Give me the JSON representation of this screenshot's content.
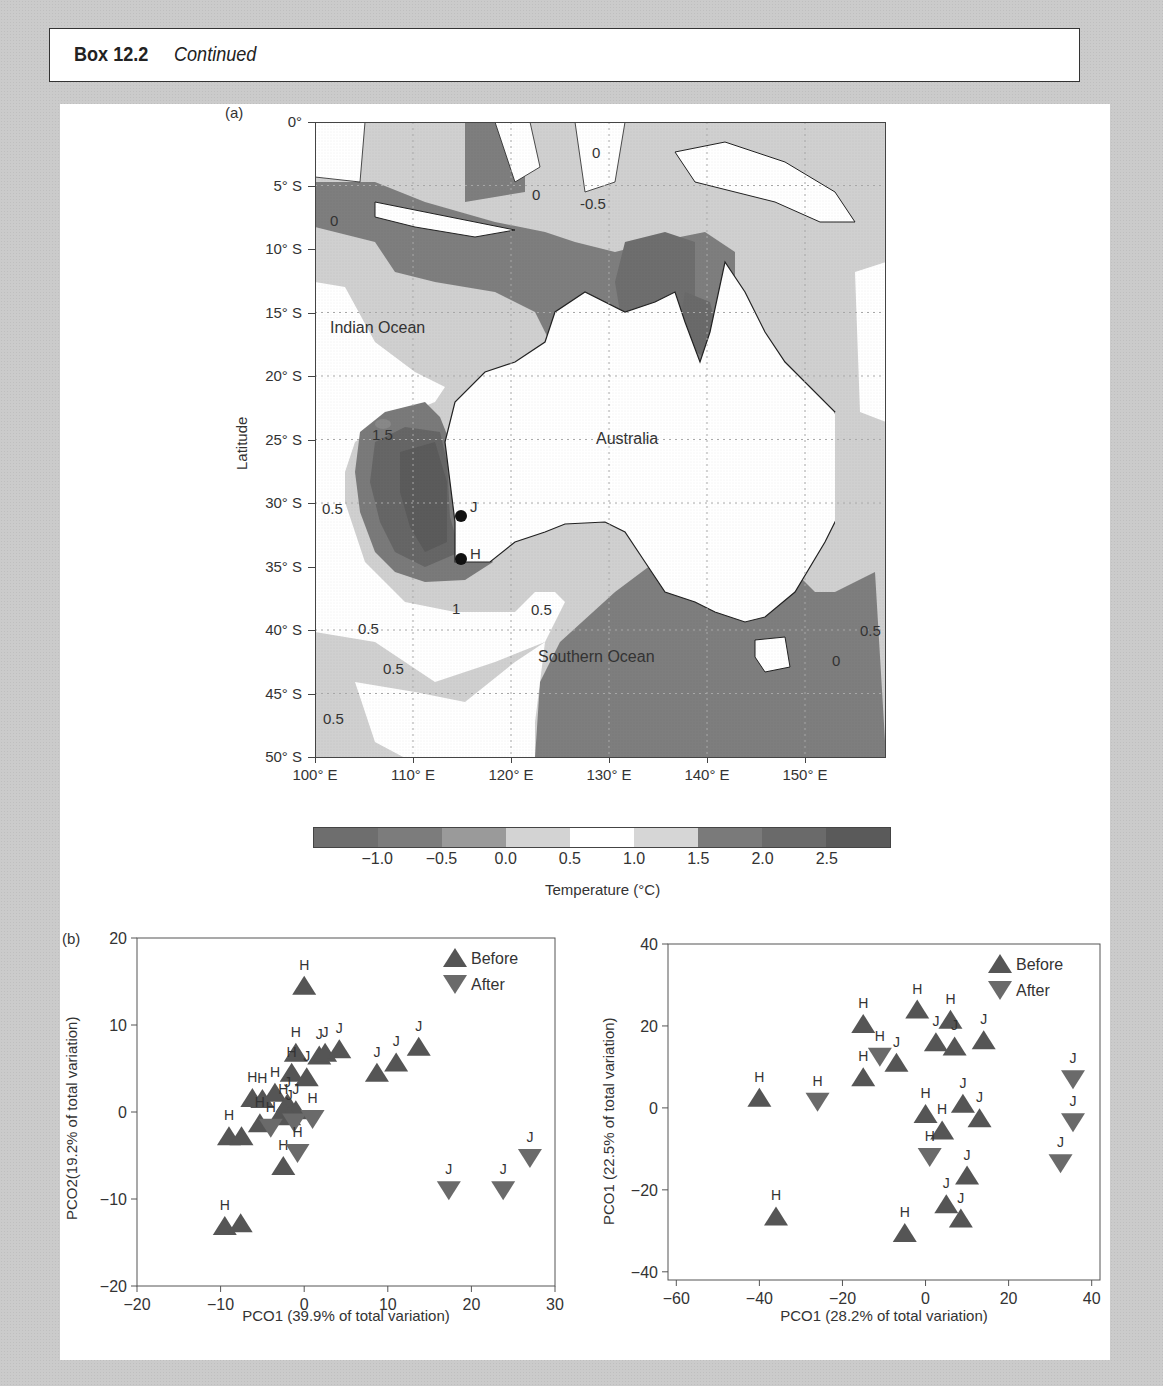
{
  "header": {
    "box_number": "Box 12.2",
    "continued": "Continued"
  },
  "panel_a": {
    "label": "(a)",
    "ylabel": "Latitude",
    "lat_ticks": [
      "0°",
      "5° S",
      "10° S",
      "15° S",
      "20° S",
      "25° S",
      "30° S",
      "35° S",
      "40° S",
      "45° S",
      "50° S"
    ],
    "lon_ticks": [
      "100° E",
      "110° E",
      "120° E",
      "130° E",
      "140° E",
      "150° E"
    ],
    "region_labels": {
      "indian_ocean": "Indian Ocean",
      "australia": "Australia",
      "southern_ocean": "Southern Ocean"
    },
    "site_labels": {
      "j": "J",
      "h": "H"
    },
    "contour_labels": [
      "0",
      "0",
      "0",
      "-0.5",
      "1.5",
      "0.5",
      "1",
      "0.5",
      "0.5",
      "0.5",
      "0.5",
      "0.5",
      "0"
    ],
    "colorbar": {
      "ticks": [
        "−1.0",
        "−0.5",
        "0.0",
        "0.5",
        "1.0",
        "1.5",
        "2.0",
        "2.5"
      ],
      "colors": [
        "#6e6e6e",
        "#7c7c7c",
        "#9a9a9a",
        "#d3d3d3",
        "#ffffff",
        "#d6d6d6",
        "#7a7a7a",
        "#6a6a6a",
        "#5a5a5a"
      ],
      "title": "Temperature (°C)"
    }
  },
  "chart_data": [
    {
      "type": "scatter",
      "panel": "(b) left",
      "title": "",
      "xlabel": "PCO1 (39.9% of total variation)",
      "ylabel": "PCO2(19.2% of total variation)",
      "xlim": [
        -20,
        30
      ],
      "ylim": [
        -20,
        20
      ],
      "xticks": [
        "−20",
        "−10",
        "0",
        "10",
        "20",
        "30"
      ],
      "yticks": [
        "20",
        "10",
        "0",
        "−10",
        "−20"
      ],
      "legend": {
        "position": "top-right",
        "entries": [
          "Before",
          "After"
        ]
      },
      "series": [
        {
          "name": "Before",
          "marker": "triangle-up",
          "points": [
            {
              "x": 0,
              "y": 14.5,
              "label": "H"
            },
            {
              "x": -1,
              "y": 6.8,
              "label": "H"
            },
            {
              "x": 1.8,
              "y": 6.5,
              "label": "J"
            },
            {
              "x": 2.5,
              "y": 6.8,
              "label": "J"
            },
            {
              "x": 4.2,
              "y": 7.2,
              "label": "J"
            },
            {
              "x": -1.5,
              "y": 4.5,
              "label": "H"
            },
            {
              "x": 0.3,
              "y": 4.0,
              "label": "J"
            },
            {
              "x": 8.7,
              "y": 4.5,
              "label": "J"
            },
            {
              "x": 11,
              "y": 5.7,
              "label": "J"
            },
            {
              "x": 13.7,
              "y": 7.5,
              "label": "J"
            },
            {
              "x": -6.2,
              "y": 1.6,
              "label": "H"
            },
            {
              "x": -5,
              "y": 1.5,
              "label": "H"
            },
            {
              "x": -3.5,
              "y": 2.2,
              "label": "H"
            },
            {
              "x": -2,
              "y": 1.0,
              "label": "J"
            },
            {
              "x": -1,
              "y": 0.2,
              "label": "J"
            },
            {
              "x": -2.5,
              "y": 0.2,
              "label": "H"
            },
            {
              "x": -5.3,
              "y": -1.3,
              "label": "H"
            },
            {
              "x": -1.8,
              "y": -0.5,
              "label": "J"
            },
            {
              "x": -9,
              "y": -2.8,
              "label": "H"
            },
            {
              "x": -7.5,
              "y": -2.8,
              "label": ""
            },
            {
              "x": -2.5,
              "y": -6.2,
              "label": "H"
            },
            {
              "x": -9.5,
              "y": -13.1,
              "label": "H"
            },
            {
              "x": -7.6,
              "y": -12.8,
              "label": ""
            }
          ]
        },
        {
          "name": "After",
          "marker": "triangle-down",
          "points": [
            {
              "x": 1.0,
              "y": -0.8,
              "label": "H"
            },
            {
              "x": -4,
              "y": -1.8,
              "label": "H"
            },
            {
              "x": -1.2,
              "y": -1.2,
              "label": ""
            },
            {
              "x": -0.8,
              "y": -4.7,
              "label": "H"
            },
            {
              "x": 17.3,
              "y": -9.0,
              "label": "J"
            },
            {
              "x": 23.8,
              "y": -9.0,
              "label": "J"
            },
            {
              "x": 27.0,
              "y": -5.3,
              "label": "J"
            }
          ]
        }
      ]
    },
    {
      "type": "scatter",
      "panel": "(b) right",
      "title": "",
      "xlabel": "PCO1 (28.2% of total variation)",
      "ylabel": "PCO1 (22.5% of total variation)",
      "xlim": [
        -62,
        42
      ],
      "ylim": [
        -42,
        40
      ],
      "xticks": [
        "−60",
        "−40",
        "−20",
        "0",
        "20",
        "40"
      ],
      "yticks": [
        "40",
        "20",
        "0",
        "−20",
        "−40"
      ],
      "legend": {
        "position": "top-right",
        "entries": [
          "Before",
          "After"
        ]
      },
      "series": [
        {
          "name": "Before",
          "marker": "triangle-up",
          "points": [
            {
              "x": -40,
              "y": 2.5,
              "label": "H"
            },
            {
              "x": -36,
              "y": -26.5,
              "label": "H"
            },
            {
              "x": -15,
              "y": 20.5,
              "label": "H"
            },
            {
              "x": -15,
              "y": 7.5,
              "label": "H"
            },
            {
              "x": -7,
              "y": 11,
              "label": "J"
            },
            {
              "x": -2,
              "y": 24,
              "label": "H"
            },
            {
              "x": 2.5,
              "y": 16,
              "label": "J"
            },
            {
              "x": 6,
              "y": 21.5,
              "label": "H"
            },
            {
              "x": 7,
              "y": 15,
              "label": "J"
            },
            {
              "x": 14,
              "y": 16.5,
              "label": "J"
            },
            {
              "x": 0,
              "y": -1.5,
              "label": "H"
            },
            {
              "x": 4,
              "y": -5.5,
              "label": "H"
            },
            {
              "x": 9,
              "y": 1,
              "label": "J"
            },
            {
              "x": 13,
              "y": -2.5,
              "label": "J"
            },
            {
              "x": 10,
              "y": -16.5,
              "label": "J"
            },
            {
              "x": 5,
              "y": -23.5,
              "label": "J"
            },
            {
              "x": 8.5,
              "y": -27,
              "label": "J"
            },
            {
              "x": -5,
              "y": -30.5,
              "label": "H"
            }
          ]
        },
        {
          "name": "After",
          "marker": "triangle-down",
          "points": [
            {
              "x": -26,
              "y": 1.5,
              "label": "H"
            },
            {
              "x": -11,
              "y": 12.5,
              "label": "H"
            },
            {
              "x": 1,
              "y": -12,
              "label": "H"
            },
            {
              "x": 35.5,
              "y": 7,
              "label": "J"
            },
            {
              "x": 35.5,
              "y": -3.5,
              "label": "J"
            },
            {
              "x": 32.5,
              "y": -13.5,
              "label": "J"
            }
          ]
        }
      ]
    }
  ]
}
